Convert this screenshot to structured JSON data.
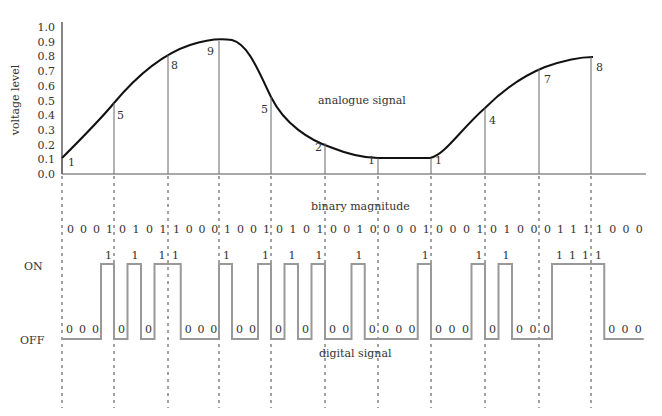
{
  "chart_data": {
    "type": "line",
    "title": "",
    "ylabel": "voltage level",
    "xlabel": "",
    "ylim": [
      0.0,
      1.0
    ],
    "y_ticks": [
      "0.0",
      "0.1",
      "0.2",
      "0.3",
      "0.4",
      "0.5",
      "0.6",
      "0.7",
      "0.8",
      "0.9",
      "1.0"
    ],
    "annotations": {
      "analogue": "analogue signal",
      "binary": "binary magnitude",
      "digital": "digital signal",
      "on": "ON",
      "off": "OFF"
    },
    "samples": [
      1,
      5,
      8,
      9,
      5,
      2,
      1,
      1,
      4,
      7,
      8
    ],
    "sample_voltages": [
      0.1,
      0.5,
      0.8,
      0.9,
      0.5,
      0.2,
      0.1,
      0.1,
      0.4,
      0.7,
      0.8
    ],
    "binary_groups": [
      "0001",
      "0101",
      "1000",
      "1001",
      "0101",
      "0010",
      "0001",
      "0001",
      "0100",
      "0111",
      "1000"
    ],
    "grid": false
  }
}
